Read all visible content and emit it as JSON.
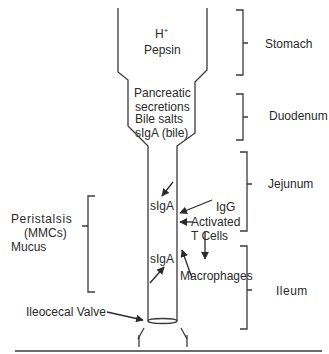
{
  "diagram": {
    "type": "gastrointestinal tract defense mechanisms schematic",
    "regions": [
      {
        "name": "Stomach",
        "contents": [
          "H+",
          "Pepsin"
        ]
      },
      {
        "name": "Duodenum",
        "contents": [
          "Pancreatic secretions",
          "Bile salts",
          "sIgA (bile)"
        ]
      },
      {
        "name": "Jejunum",
        "contents": [
          "sIgA",
          "IgG",
          "Activated T Cells"
        ]
      },
      {
        "name": "Ileum",
        "contents": [
          "sIgA",
          "Macrophages"
        ]
      }
    ],
    "left_annotations": {
      "motility": [
        "Peristalsis",
        "(MMCs)",
        "Mucus"
      ],
      "valve": "Ileocecal Valve"
    }
  },
  "labels": {
    "h_plus": "H",
    "h_plus_sup": "+",
    "pepsin": "Pepsin",
    "pancreatic": "Pancreatic",
    "secretions": "secretions",
    "bile_salts": "Bile  salts",
    "siga_bile": "sIgA  (bile)",
    "siga_upper": "sIgA",
    "igg": "IgG",
    "activated": "Activated",
    "t_cells": "T  Cells",
    "siga_lower": "sIgA",
    "macrophages": "Macrophages",
    "peristalsis": "Peristalsis",
    "mmcs": "(MMCs)",
    "mucus": "Mucus",
    "ileocecal_valve": "Ileocecal  Valve",
    "stomach": "Stomach",
    "duodenum": "Duodenum",
    "jejunum": "Jejunum",
    "ileum": "Ileum"
  }
}
